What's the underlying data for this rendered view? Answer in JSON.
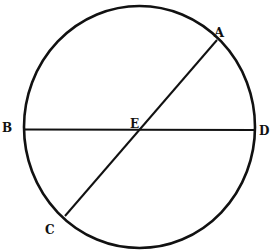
{
  "diagram": {
    "type": "geometric-figure",
    "stroke_color": "#111111",
    "background": "#ffffff",
    "circle": {
      "cx": 139.5,
      "cy": 127,
      "rx": 115.5,
      "ry": 121
    },
    "lines": [
      {
        "id": "BD",
        "x1": 24,
        "y1": 129.5,
        "x2": 255,
        "y2": 130
      },
      {
        "id": "AC",
        "x1": 217,
        "y1": 40,
        "x2": 65,
        "y2": 216
      }
    ],
    "points": {
      "A": {
        "label": "A",
        "x": 219,
        "y": 37
      },
      "B": {
        "label": "B",
        "x": 3,
        "y": 132
      },
      "C": {
        "label": "C",
        "x": 46,
        "y": 233
      },
      "D": {
        "label": "D",
        "x": 259,
        "y": 135
      },
      "E": {
        "label": "E",
        "x": 129,
        "y": 128
      }
    }
  }
}
